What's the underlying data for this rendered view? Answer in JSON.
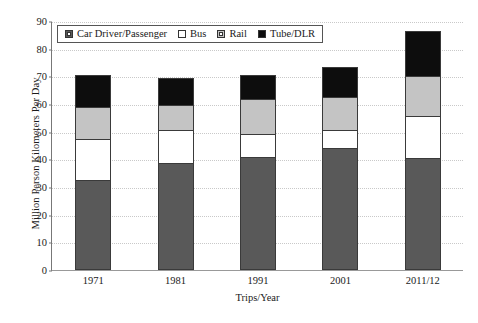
{
  "chart_data": {
    "type": "bar",
    "subtype": "stacked-bar",
    "title": "",
    "xlabel": "Trips/Year",
    "ylabel": "Million Person Kilometers Per Day",
    "categories": [
      "1971",
      "1981",
      "1991",
      "2001",
      "2011/12"
    ],
    "ylim": [
      0,
      90
    ],
    "ytick_labels": [
      "0",
      "10",
      "20",
      "30",
      "40",
      "50",
      "60",
      "70",
      "80",
      "90"
    ],
    "ytick_values": [
      0,
      10,
      20,
      30,
      40,
      50,
      60,
      70,
      80,
      90
    ],
    "grid": true,
    "grid_axis": "y",
    "grid_style": "dotted",
    "legend_position": "top-left-inside",
    "series": [
      {
        "name": "Car Driver/Passenger",
        "color": "#595959",
        "values": [
          32.5,
          38.5,
          41.0,
          44.0,
          40.5
        ]
      },
      {
        "name": "Bus",
        "color": "#ffffff",
        "values": [
          15.0,
          12.0,
          8.0,
          6.5,
          15.0
        ]
      },
      {
        "name": "Rail",
        "color": "#c4c4c4",
        "values": [
          11.5,
          9.0,
          13.0,
          12.0,
          14.5
        ]
      },
      {
        "name": "Tube/DLR",
        "color": "#0d0d0d",
        "values": [
          11.5,
          10.0,
          8.5,
          11.0,
          16.5
        ]
      }
    ],
    "totals": [
      70.5,
      69.5,
      70.5,
      73.5,
      86.5
    ]
  },
  "legend": {
    "items": [
      {
        "label": "Car Driver/Passenger",
        "swatch": "dark-grey-swatch"
      },
      {
        "label": "Bus",
        "swatch": "white-swatch"
      },
      {
        "label": "Rail",
        "swatch": "light-grey-swatch"
      },
      {
        "label": "Tube/DLR",
        "swatch": "black-swatch"
      }
    ]
  }
}
